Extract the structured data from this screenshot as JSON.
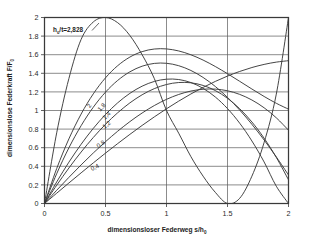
{
  "chart_data": {
    "type": "line",
    "title": "",
    "xlabel": "dimensionsloser Federweg  s/h",
    "xlabel_sub": "0",
    "ylabel": "dimensionslose Federkraft  F/F",
    "ylabel_sub": "0",
    "xlim": [
      0,
      2
    ],
    "ylim": [
      0,
      2
    ],
    "xticks": [
      "0",
      "0.5",
      "1",
      "1.5",
      "2"
    ],
    "xtick_values": [
      0,
      0.5,
      1,
      1.5,
      2
    ],
    "yticks": [
      "0",
      "0.2",
      "0.4",
      "0.6",
      "0.8",
      "1",
      "1.2",
      "1.4",
      "1.6",
      "1.8",
      "2"
    ],
    "ytick_values": [
      0,
      0.2,
      0.4,
      0.6,
      0.8,
      1,
      1.2,
      1.4,
      1.6,
      1.8,
      2
    ],
    "grid": true,
    "legend_position": "inline-curve-labels",
    "annotation": "h /t=2,828",
    "annotation_sub": "0",
    "curve_param_name": "h0/t",
    "series": [
      {
        "name": "0.4",
        "h0_over_t": 0.4,
        "label": "0,4",
        "label_x": 0.42,
        "label_y": 0.37,
        "points_x": [
          0,
          0.1,
          0.2,
          0.3,
          0.4,
          0.5,
          0.6,
          0.7,
          0.8,
          0.9,
          1.0,
          1.1,
          1.2,
          1.3,
          1.4,
          1.5,
          1.6,
          1.7,
          1.8,
          1.9,
          2.0
        ],
        "points_y": [
          0,
          0.1106,
          0.2206,
          0.3294,
          0.4366,
          0.5417,
          0.6442,
          0.7436,
          0.8394,
          0.9312,
          1.0185,
          1.1008,
          1.1776,
          1.2484,
          1.3127,
          1.3701,
          1.42,
          1.462,
          1.4956,
          1.5203,
          1.5357
        ]
      },
      {
        "name": "0.8",
        "h0_over_t": 0.8,
        "label": "0,8",
        "label_x": 0.47,
        "label_y": 0.62,
        "points_x": [
          0,
          0.1,
          0.2,
          0.3,
          0.4,
          0.5,
          0.6,
          0.7,
          0.8,
          0.9,
          1.0,
          1.1,
          1.2,
          1.3,
          1.4,
          1.5,
          1.6,
          1.7,
          1.8,
          1.9,
          2.0
        ],
        "points_y": [
          0,
          0.1422,
          0.281,
          0.4151,
          0.5434,
          0.6645,
          0.7773,
          0.8805,
          0.9728,
          1.0531,
          1.12,
          1.1724,
          1.209,
          1.2286,
          1.23,
          1.212,
          1.1733,
          1.1128,
          1.0293,
          0.9215,
          0.7883
        ]
      },
      {
        "name": "1.2",
        "h0_over_t": 1.2,
        "label": "1,2",
        "label_x": 0.52,
        "label_y": 0.83,
        "points_x": [
          0,
          0.1,
          0.2,
          0.3,
          0.4,
          0.5,
          0.6,
          0.7,
          0.8,
          0.9,
          1.0,
          1.1,
          1.2,
          1.3,
          1.4,
          1.5,
          1.6,
          1.7,
          1.8,
          1.9,
          2.0
        ],
        "points_y": [
          0,
          0.1967,
          0.3814,
          0.553,
          0.71,
          0.8514,
          0.9758,
          1.082,
          1.1689,
          1.2351,
          1.2796,
          1.3009,
          1.298,
          1.2696,
          1.2144,
          1.1313,
          1.0191,
          0.8765,
          0.7024,
          0.4956,
          0.2548
        ]
      },
      {
        "name": "1.4",
        "h0_over_t": 1.4,
        "label": "1,4",
        "label_x": 0.52,
        "label_y": 0.93,
        "points_x": [
          0,
          0.1,
          0.2,
          0.3,
          0.4,
          0.5,
          0.6,
          0.7,
          0.8,
          0.9,
          1.0,
          1.1,
          1.2,
          1.3,
          1.4,
          1.5,
          1.6,
          1.7,
          1.8,
          1.9,
          2.0
        ],
        "points_y": [
          0,
          0.2319,
          0.4444,
          0.6367,
          0.8078,
          0.9568,
          1.0827,
          1.1846,
          1.2615,
          1.3125,
          1.3367,
          1.333,
          1.3005,
          1.2383,
          1.1453,
          1.0206,
          0.8633,
          0.6723,
          0.4468,
          0.1857,
          -0.112
        ]
      },
      {
        "name": "1.8",
        "h0_over_t": 1.8,
        "label": "1,8",
        "label_x": 0.48,
        "label_y": 1.02,
        "points_x": [
          0,
          0.1,
          0.2,
          0.3,
          0.4,
          0.5,
          0.6,
          0.7,
          0.8,
          0.9,
          1.0,
          1.1,
          1.2,
          1.3,
          1.4,
          1.5,
          1.6,
          1.7,
          1.8,
          1.9,
          2.0
        ],
        "points_y": [
          0,
          0.3205,
          0.5987,
          0.8365,
          1.0354,
          1.1972,
          1.3235,
          1.416,
          1.4764,
          1.5064,
          1.5076,
          1.4817,
          1.4304,
          1.3554,
          1.2583,
          1.1409,
          1.0047,
          0.8515,
          0.683,
          0.5008,
          0.3066
        ]
      },
      {
        "name": "2",
        "h0_over_t": 2.0,
        "label": "2",
        "label_x": 0.38,
        "label_y": 1.04,
        "points_x": [
          0,
          0.1,
          0.2,
          0.3,
          0.4,
          0.5,
          0.6,
          0.7,
          0.8,
          0.9,
          1.0,
          1.1,
          1.2,
          1.3,
          1.4,
          1.5,
          1.6,
          1.7,
          1.8,
          1.9,
          2.0
        ],
        "points_y": [
          0,
          0.3757,
          0.695,
          0.9615,
          1.179,
          1.3512,
          1.4818,
          1.5745,
          1.633,
          1.661,
          1.6622,
          1.6403,
          1.599,
          1.542,
          1.473,
          1.3957,
          1.3138,
          1.231,
          1.151,
          1.0775,
          1.0142
        ]
      },
      {
        "name": "2.828",
        "h0_over_t": 2.828,
        "label": "h0/t=2,828",
        "label_x": 0.12,
        "label_y": 1.83,
        "points_x": [
          0,
          0.1,
          0.2,
          0.3,
          0.4,
          0.5,
          0.6,
          0.7,
          0.8,
          0.9,
          1.0,
          1.1,
          1.2,
          1.3,
          1.4,
          1.5,
          1.6,
          1.7,
          1.8,
          1.9,
          2.0
        ],
        "points_y": [
          0,
          0.76,
          1.344,
          1.764,
          1.952,
          2.0,
          1.944,
          1.806,
          1.6,
          1.344,
          1.0,
          0.756,
          0.504,
          0.294,
          0.12,
          0.0,
          0.056,
          0.294,
          0.656,
          1.176,
          2.0
        ]
      }
    ],
    "convergence_points": [
      {
        "x": 1,
        "y": 1
      },
      {
        "x": 2,
        "y": 2
      }
    ]
  },
  "axes": {
    "x_title_main": "dimensionsloser Federweg  s/h",
    "x_title_sub": "0",
    "y_title_main": "dimensionslose Federkraft  F/F",
    "y_title_sub": "0"
  },
  "annotation": {
    "prefix": "h",
    "sub": "0",
    "suffix": "/t=2,828"
  }
}
